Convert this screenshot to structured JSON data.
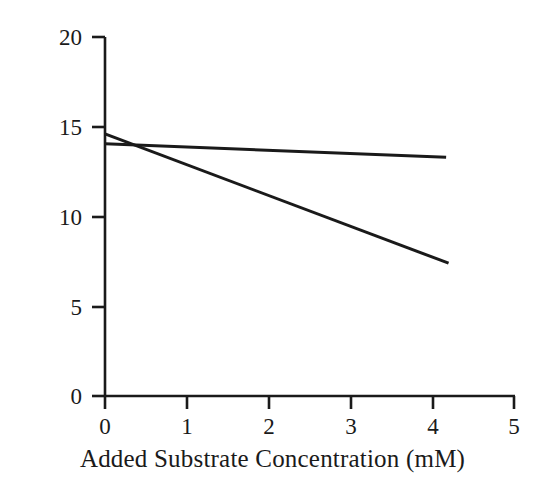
{
  "figure": {
    "background_color": "#ffffff",
    "line_color": "#1a1a1a",
    "text_color": "#1a1a1a"
  },
  "chart_data": {
    "type": "line",
    "title": "",
    "subtitle": "",
    "xlabel": "Added Substrate Concentration (mM)",
    "ylabel": "Adhesion Force (nN)",
    "xlim": [
      0,
      5
    ],
    "ylim": [
      0,
      20
    ],
    "xticks": [
      0,
      1,
      2,
      3,
      4,
      5
    ],
    "xtick_labels": [
      "0",
      "1",
      "2",
      "3",
      "4",
      "5"
    ],
    "yticks": [
      0,
      5,
      10,
      15,
      20
    ],
    "ytick_labels": [
      "0",
      "5",
      "10",
      "15",
      "20"
    ],
    "grid": false,
    "legend": null,
    "annotations": [],
    "series": [
      {
        "name": "steep-decline-line",
        "x": [
          0,
          4.2
        ],
        "y": [
          14.6,
          7.4
        ],
        "slope": -1.71,
        "intercept": 14.6,
        "color": "#1a1a1a",
        "line_width": 3
      },
      {
        "name": "shallow-decline-line",
        "x": [
          0,
          4.17
        ],
        "y": [
          14.05,
          13.3
        ],
        "slope": -0.18,
        "intercept": 14.05,
        "color": "#1a1a1a",
        "line_width": 3
      }
    ]
  }
}
